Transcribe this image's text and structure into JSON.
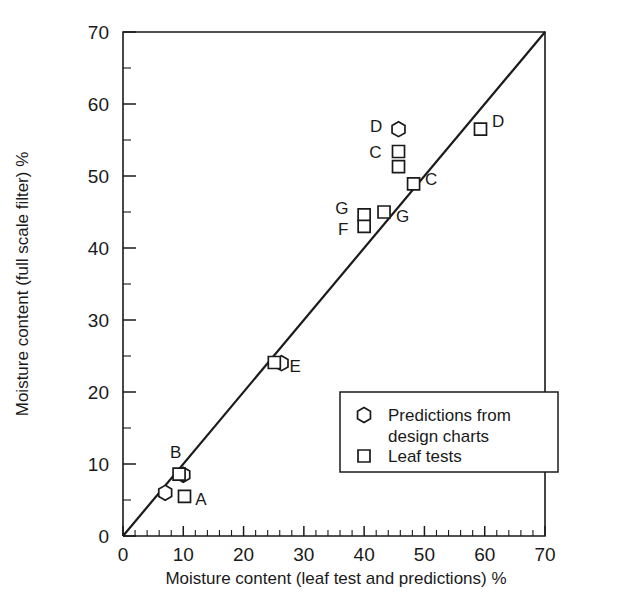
{
  "chart_data": {
    "type": "scatter",
    "title": "",
    "xlabel": "Moisture content (leaf test and predictions)  %",
    "ylabel": "Moisture content (full scale filter)  %",
    "xlim": [
      0,
      70
    ],
    "ylim": [
      0,
      70
    ],
    "xticks": [
      0,
      10,
      20,
      30,
      40,
      50,
      60,
      70
    ],
    "yticks": [
      0,
      10,
      20,
      30,
      40,
      50,
      60,
      70
    ],
    "xtick_labels": [
      "0",
      "10",
      "20",
      "30",
      "40",
      "50",
      "60",
      "70"
    ],
    "ytick_labels": [
      "0",
      "10",
      "20",
      "30",
      "40",
      "50",
      "60",
      "70"
    ],
    "x_minor_step": 2,
    "y_minor_step": 5,
    "grid": false,
    "legend_position": "lower right",
    "reference_line": {
      "name": "1:1 line",
      "from": [
        0,
        0
      ],
      "to": [
        70,
        70
      ]
    },
    "series": [
      {
        "name": "Predictions from design charts",
        "marker": "hexagon",
        "points": [
          {
            "x": 7.0,
            "y": 6.0
          },
          {
            "x": 10.0,
            "y": 8.5
          },
          {
            "x": 26.3,
            "y": 24.0
          },
          {
            "x": 45.7,
            "y": 56.5
          }
        ]
      },
      {
        "name": "Leaf tests",
        "marker": "square",
        "points": [
          {
            "x": 9.3,
            "y": 8.6
          },
          {
            "x": 10.2,
            "y": 5.5
          },
          {
            "x": 25.1,
            "y": 24.1
          },
          {
            "x": 40.0,
            "y": 44.6
          },
          {
            "x": 40.0,
            "y": 43.0
          },
          {
            "x": 43.3,
            "y": 45.0
          },
          {
            "x": 45.7,
            "y": 53.4
          },
          {
            "x": 45.7,
            "y": 51.3
          },
          {
            "x": 48.2,
            "y": 48.9
          },
          {
            "x": 59.3,
            "y": 56.5
          }
        ]
      }
    ],
    "point_labels": [
      {
        "text": "A",
        "x": 12.0,
        "y": 5.2,
        "anchor": "start"
      },
      {
        "text": "B",
        "x": 7.8,
        "y": 11.6,
        "anchor": "start"
      },
      {
        "text": "C",
        "x": 42.9,
        "y": 53.4,
        "anchor": "end"
      },
      {
        "text": "C",
        "x": 50.1,
        "y": 49.6,
        "anchor": "start"
      },
      {
        "text": "D",
        "x": 43.0,
        "y": 56.9,
        "anchor": "end"
      },
      {
        "text": "D",
        "x": 61.2,
        "y": 57.6,
        "anchor": "start"
      },
      {
        "text": "E",
        "x": 27.6,
        "y": 23.6,
        "anchor": "start"
      },
      {
        "text": "F",
        "x": 37.4,
        "y": 42.7,
        "anchor": "end"
      },
      {
        "text": "G",
        "x": 37.4,
        "y": 45.6,
        "anchor": "end"
      },
      {
        "text": "G",
        "x": 45.3,
        "y": 44.4,
        "anchor": "start"
      }
    ],
    "legend": {
      "entries": [
        {
          "marker": "hexagon",
          "label_line1": "Predictions from",
          "label_line2": "design charts"
        },
        {
          "marker": "square",
          "label_line1": "Leaf tests",
          "label_line2": ""
        }
      ]
    },
    "colors": {
      "line": "#1a1a1a",
      "marker_fill": "#ffffff",
      "marker_stroke": "#1a1a1a",
      "background": "#ffffff"
    }
  }
}
